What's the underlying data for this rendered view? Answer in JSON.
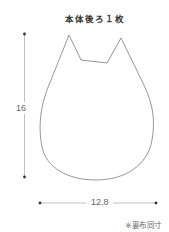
{
  "title": "本体後ろ１枚",
  "dimensions": {
    "height": "16",
    "width": "12.8"
  },
  "note": "※裏布同寸",
  "colors": {
    "outline": "#8a8a8a",
    "dimension_line": "#9a9a9a",
    "dimension_dot": "#333333",
    "text": "#333333"
  }
}
